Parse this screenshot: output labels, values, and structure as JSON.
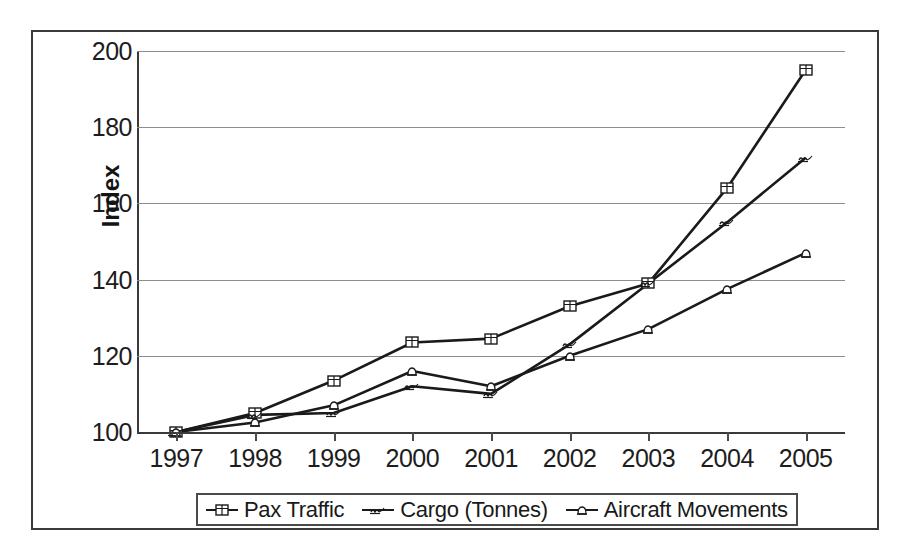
{
  "chart_data": {
    "type": "line",
    "title": "",
    "xlabel": "",
    "ylabel": "Index",
    "x": [
      "1997",
      "1998",
      "1999",
      "2000",
      "2001",
      "2002",
      "2003",
      "2004",
      "2005"
    ],
    "categories": [
      "1997",
      "1998",
      "1999",
      "2000",
      "2001",
      "2002",
      "2003",
      "2004",
      "2005"
    ],
    "ylim": [
      100,
      200
    ],
    "yticks": [
      100,
      120,
      140,
      160,
      180,
      200
    ],
    "ytick_labels": [
      "100",
      "120",
      "140",
      "160",
      "180",
      "200"
    ],
    "grid": "horizontal",
    "legend_position": "bottom",
    "series": [
      {
        "name": "Pax Traffic",
        "marker": "square-book-icon",
        "color": "#1a1a1a",
        "values": [
          100,
          105,
          113.5,
          123.5,
          124.5,
          133,
          139,
          164,
          195
        ]
      },
      {
        "name": "Cargo (Tonnes)",
        "marker": "squiggle-icon",
        "color": "#1a1a1a",
        "values": [
          100,
          104.5,
          105,
          112,
          110,
          123,
          139,
          155,
          172
        ]
      },
      {
        "name": "Aircraft Movements",
        "marker": "bell-icon",
        "color": "#1a1a1a",
        "values": [
          100,
          102.5,
          107,
          116,
          112,
          120,
          127,
          137.5,
          147
        ]
      }
    ]
  },
  "legend": {
    "entries": [
      {
        "label": "Pax Traffic",
        "key": "square-book-icon"
      },
      {
        "label": "Cargo (Tonnes)",
        "key": "squiggle-icon"
      },
      {
        "label": "Aircraft Movements",
        "key": "bell-icon"
      }
    ]
  }
}
